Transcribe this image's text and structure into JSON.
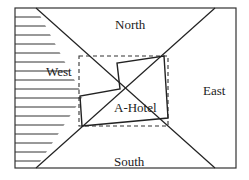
{
  "diagram": {
    "labels": {
      "north": "North",
      "south": "South",
      "east": "East",
      "west": "West",
      "hotel": "A-Hotel"
    },
    "colors": {
      "stroke": "#222222",
      "background": "#ffffff"
    }
  }
}
